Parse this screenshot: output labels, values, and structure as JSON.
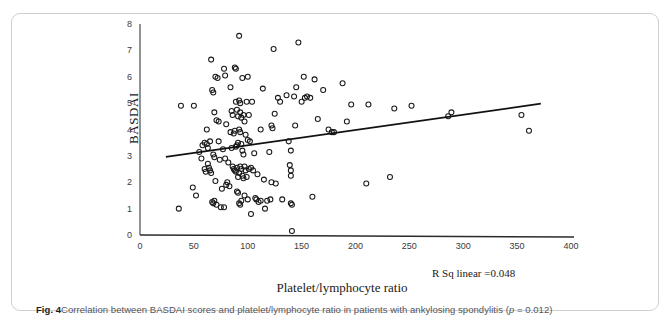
{
  "running_head": "",
  "figure": {
    "label": "Fig. 4",
    "caption_text": "Correlation between BASDAI scores and platelet/lymphocyte ratio in patients with ankylosing spondylitis (",
    "caption_p_italic": "p",
    "caption_p_value": " = 0.012)"
  },
  "annotation": {
    "r_sq": "R Sq linear =0.048"
  },
  "chart_data": {
    "type": "scatter",
    "title": "",
    "xlabel": "Platelet/lymphocyte ratio",
    "ylabel": "BASDAI",
    "xlim": [
      0,
      400
    ],
    "ylim": [
      0,
      8
    ],
    "xticks": [
      0,
      50,
      100,
      150,
      200,
      250,
      300,
      350,
      400
    ],
    "yticks": [
      0,
      1,
      2,
      3,
      4,
      5,
      6,
      7,
      8
    ],
    "xtick_labels": [
      "0",
      "50",
      "100",
      "150",
      "200",
      "250",
      "300",
      "350",
      "400"
    ],
    "ytick_labels": [
      "0",
      "1",
      "2",
      "3",
      "4",
      "5",
      "6",
      "7",
      "8"
    ],
    "grid": false,
    "legend": "none",
    "marker": "open-circle",
    "marker_color": "#1a1a1a",
    "fit_line": {
      "label": "R Sq linear =0.048",
      "r_squared": 0.048,
      "p_value": 0.012,
      "x_start": 24,
      "y_start": 2.96,
      "x_end": 372,
      "y_end": 4.98
    },
    "points": [
      [
        36,
        1.0
      ],
      [
        38,
        4.9
      ],
      [
        50,
        4.9
      ],
      [
        49,
        1.8
      ],
      [
        52,
        1.5
      ],
      [
        55,
        3.15
      ],
      [
        57,
        2.9
      ],
      [
        58,
        3.4
      ],
      [
        60,
        3.5
      ],
      [
        60,
        2.5
      ],
      [
        61,
        2.4
      ],
      [
        62,
        4.0
      ],
      [
        62,
        3.45
      ],
      [
        63,
        3.3
      ],
      [
        63,
        2.7
      ],
      [
        64,
        2.55
      ],
      [
        65,
        3.55
      ],
      [
        65,
        2.45
      ],
      [
        66,
        6.65
      ],
      [
        66,
        2.35
      ],
      [
        67,
        5.5
      ],
      [
        67,
        1.25
      ],
      [
        68,
        5.4
      ],
      [
        68,
        3.05
      ],
      [
        68,
        1.2
      ],
      [
        69,
        4.65
      ],
      [
        69,
        2.95
      ],
      [
        69,
        1.3
      ],
      [
        70,
        6.0
      ],
      [
        70,
        2.05
      ],
      [
        71,
        4.35
      ],
      [
        71,
        1.15
      ],
      [
        72,
        5.95
      ],
      [
        73,
        4.3
      ],
      [
        73,
        3.55
      ],
      [
        74,
        2.85
      ],
      [
        75,
        1.05
      ],
      [
        76,
        1.75
      ],
      [
        77,
        3.25
      ],
      [
        78,
        6.3
      ],
      [
        78,
        1.05
      ],
      [
        79,
        6.05
      ],
      [
        79,
        2.9
      ],
      [
        80,
        4.2
      ],
      [
        80,
        1.9
      ],
      [
        81,
        2.0
      ],
      [
        82,
        2.75
      ],
      [
        83,
        1.85
      ],
      [
        84,
        5.6
      ],
      [
        84,
        3.9
      ],
      [
        85,
        4.7
      ],
      [
        85,
        3.3
      ],
      [
        86,
        4.55
      ],
      [
        86,
        2.6
      ],
      [
        87,
        3.85
      ],
      [
        87,
        2.5
      ],
      [
        88,
        6.35
      ],
      [
        88,
        3.95
      ],
      [
        88,
        2.45
      ],
      [
        89,
        6.3
      ],
      [
        89,
        5.05
      ],
      [
        89,
        3.35
      ],
      [
        89,
        2.4
      ],
      [
        90,
        4.75
      ],
      [
        90,
        3.4
      ],
      [
        90,
        2.55
      ],
      [
        90,
        1.65
      ],
      [
        91,
        4.5
      ],
      [
        91,
        3.5
      ],
      [
        91,
        2.2
      ],
      [
        91,
        1.6
      ],
      [
        92,
        7.55
      ],
      [
        92,
        5.1
      ],
      [
        92,
        4.0
      ],
      [
        92,
        2.35
      ],
      [
        92,
        1.2
      ],
      [
        93,
        5.0
      ],
      [
        93,
        4.65
      ],
      [
        93,
        3.9
      ],
      [
        93,
        2.6
      ],
      [
        93,
        1.15
      ],
      [
        94,
        4.45
      ],
      [
        94,
        3.45
      ],
      [
        94,
        2.5
      ],
      [
        94,
        1.3
      ],
      [
        95,
        5.95
      ],
      [
        95,
        3.2
      ],
      [
        95,
        2.25
      ],
      [
        96,
        4.55
      ],
      [
        96,
        3.05
      ],
      [
        96,
        2.15
      ],
      [
        97,
        4.3
      ],
      [
        97,
        2.6
      ],
      [
        97,
        1.5
      ],
      [
        98,
        3.8
      ],
      [
        98,
        2.45
      ],
      [
        99,
        5.05
      ],
      [
        99,
        2.2
      ],
      [
        100,
        6.0
      ],
      [
        100,
        3.6
      ],
      [
        100,
        1.35
      ],
      [
        101,
        4.55
      ],
      [
        101,
        2.5
      ],
      [
        102,
        3.55
      ],
      [
        103,
        2.55
      ],
      [
        103,
        0.8
      ],
      [
        104,
        5.05
      ],
      [
        105,
        2.45
      ],
      [
        106,
        3.1
      ],
      [
        107,
        1.4
      ],
      [
        108,
        1.35
      ],
      [
        109,
        2.3
      ],
      [
        110,
        1.25
      ],
      [
        112,
        4.0
      ],
      [
        112,
        1.3
      ],
      [
        114,
        5.55
      ],
      [
        115,
        2.1
      ],
      [
        116,
        1.0
      ],
      [
        118,
        1.3
      ],
      [
        120,
        3.15
      ],
      [
        121,
        1.35
      ],
      [
        122,
        4.15
      ],
      [
        122,
        2.0
      ],
      [
        123,
        4.05
      ],
      [
        124,
        7.05
      ],
      [
        125,
        4.6
      ],
      [
        126,
        1.95
      ],
      [
        128,
        5.2
      ],
      [
        130,
        5.05
      ],
      [
        132,
        1.35
      ],
      [
        136,
        5.3
      ],
      [
        138,
        3.55
      ],
      [
        139,
        2.65
      ],
      [
        140,
        3.2
      ],
      [
        140,
        2.45
      ],
      [
        140,
        2.25
      ],
      [
        140,
        1.2
      ],
      [
        141,
        1.15
      ],
      [
        141,
        0.15
      ],
      [
        143,
        5.25
      ],
      [
        144,
        4.15
      ],
      [
        145,
        5.6
      ],
      [
        147,
        7.3
      ],
      [
        150,
        5.05
      ],
      [
        152,
        6.0
      ],
      [
        153,
        5.2
      ],
      [
        155,
        5.25
      ],
      [
        158,
        5.2
      ],
      [
        160,
        1.45
      ],
      [
        162,
        5.9
      ],
      [
        165,
        4.4
      ],
      [
        170,
        5.5
      ],
      [
        175,
        4.0
      ],
      [
        178,
        3.9
      ],
      [
        180,
        3.9
      ],
      [
        188,
        5.75
      ],
      [
        192,
        4.3
      ],
      [
        196,
        4.95
      ],
      [
        210,
        1.95
      ],
      [
        212,
        4.95
      ],
      [
        232,
        2.2
      ],
      [
        236,
        4.8
      ],
      [
        252,
        4.9
      ],
      [
        286,
        4.5
      ],
      [
        289,
        4.65
      ],
      [
        354,
        4.55
      ],
      [
        361,
        3.95
      ]
    ]
  }
}
